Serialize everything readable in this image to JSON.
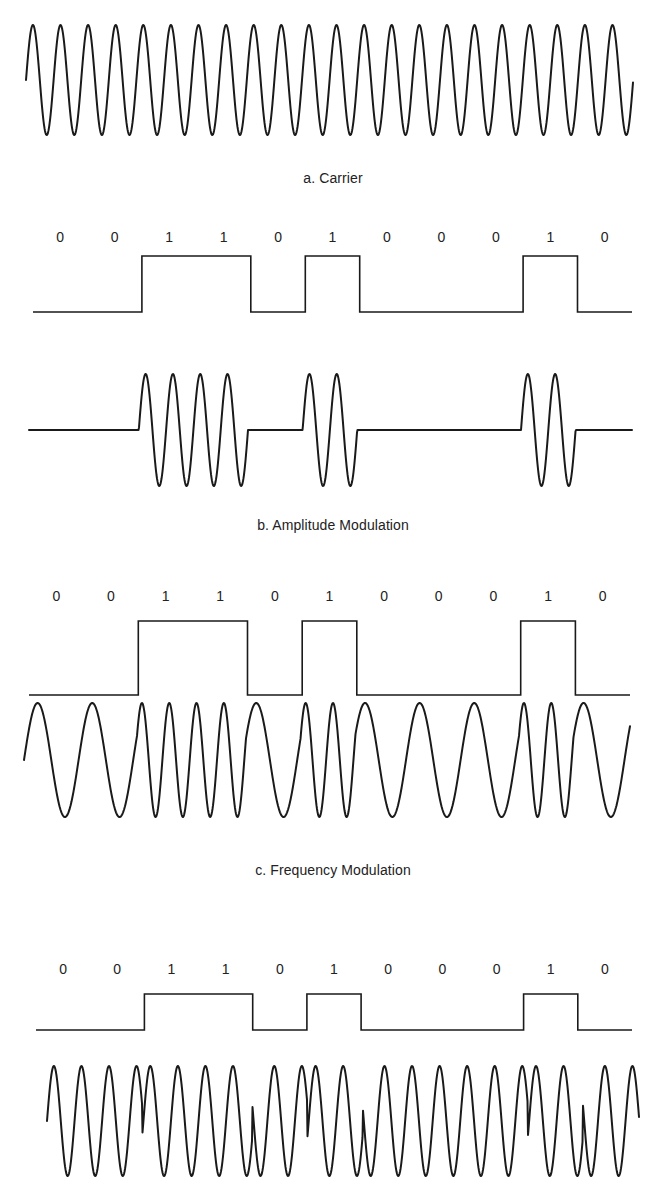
{
  "figure": {
    "bits": [
      0,
      0,
      1,
      1,
      0,
      1,
      0,
      0,
      0,
      1,
      0
    ],
    "bit_labels": [
      "0",
      "0",
      "1",
      "1",
      "0",
      "1",
      "0",
      "0",
      "0",
      "1",
      "0"
    ],
    "line_color": "#1a1a1a",
    "panels": [
      {
        "id": "carrier",
        "caption": "a. Carrier",
        "type": "carrier",
        "x_start": 26,
        "x_end": 633,
        "mid_y": 80,
        "amplitude": 55,
        "period": 27.6
      },
      {
        "id": "amplitude",
        "caption": "b. Amplitude Modulation",
        "type": "am",
        "bit_label_y": 238,
        "digital": {
          "x_start": 33,
          "x_end": 632,
          "high_y": 256,
          "low_y": 312,
          "transitions": [
            139,
            250,
            305,
            359,
            523,
            577
          ]
        },
        "wave": {
          "x_start": 29,
          "x_end": 632,
          "mid_y": 430,
          "amplitude": 56,
          "bit_start": 29.6,
          "bit_width": 54.6
        }
      },
      {
        "id": "frequency",
        "caption": "c. Frequency Modulation",
        "type": "fm",
        "bit_label_y": 597,
        "digital": {
          "x_start": 29,
          "x_end": 630,
          "high_y": 621,
          "low_y": 695,
          "transitions": [
            138,
            246,
            302,
            356,
            522,
            577
          ]
        },
        "wave": {
          "x_start": 24,
          "x_end": 630,
          "mid_y": 760,
          "amplitude": 57,
          "bit_start": 27.5,
          "bit_width": 54.6
        }
      },
      {
        "id": "phase",
        "caption": "",
        "type": "psk",
        "bit_label_y": 970,
        "digital": {
          "x_start": 36,
          "x_end": 632,
          "high_y": 994,
          "low_y": 1030,
          "transitions": [
            141,
            251,
            307,
            361,
            526,
            580
          ]
        },
        "wave": {
          "x_start": 47,
          "x_end": 639,
          "mid_y": 1121,
          "amplitude": 55,
          "bit_start": 32,
          "bit_width": 55.1
        }
      }
    ],
    "caption_positions": [
      170,
      517,
      862
    ]
  }
}
